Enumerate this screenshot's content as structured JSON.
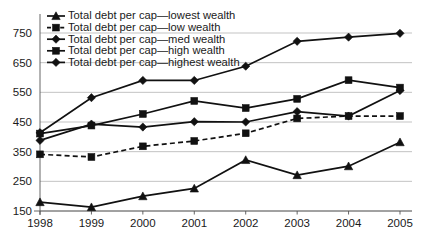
{
  "chart_data": {
    "type": "line",
    "title": "",
    "subtitle": "",
    "xlabel": "",
    "ylabel": "",
    "categories": [
      "1998",
      "1999",
      "2000",
      "2001",
      "2002",
      "2003",
      "2004",
      "2005"
    ],
    "x": [
      1998,
      1999,
      2000,
      2001,
      2002,
      2003,
      2004,
      2005
    ],
    "ylim": [
      150,
      790
    ],
    "yticks": [
      150,
      250,
      350,
      450,
      550,
      650,
      750
    ],
    "ytick_labels": [
      "150",
      "250",
      "350",
      "450",
      "550",
      "650",
      "750"
    ],
    "xtick_labels": [
      "1998",
      "1999",
      "2000",
      "2001",
      "2002",
      "2003",
      "2004",
      "2005"
    ],
    "grid": true,
    "legend_position": "top-left",
    "series": [
      {
        "name": "Total debt per cap—lowest wealth",
        "short_name": "lowest wealth",
        "marker": "triangle",
        "linestyle": "solid",
        "color": "#111111",
        "values": [
          180,
          163,
          200,
          226,
          322,
          271,
          301,
          382
        ]
      },
      {
        "name": "Total debt per cap—low wealth",
        "short_name": "low wealth",
        "marker": "square",
        "linestyle": "dashed",
        "color": "#111111",
        "values": [
          341,
          332,
          368,
          386,
          412,
          462,
          470,
          470
        ]
      },
      {
        "name": "Total debt per cap—med wealth",
        "short_name": "med wealth",
        "marker": "diamond",
        "linestyle": "solid",
        "color": "#111111",
        "values": [
          388,
          443,
          433,
          451,
          450,
          485,
          470,
          556
        ]
      },
      {
        "name": "Total debt per cap—high wealth",
        "short_name": "high wealth",
        "marker": "square",
        "linestyle": "solid",
        "color": "#111111",
        "values": [
          411,
          438,
          477,
          521,
          497,
          528,
          591,
          566
        ]
      },
      {
        "name": "Total debt per cap—highest wealth",
        "short_name": "highest wealth",
        "marker": "diamond",
        "linestyle": "solid",
        "color": "#111111",
        "values": [
          414,
          532,
          590,
          590,
          638,
          722,
          736,
          749
        ]
      }
    ],
    "legend": [
      "Total debt per cap—lowest wealth",
      "Total debt per cap—low wealth",
      "Total debt per cap—med wealth",
      "Total debt per cap—high wealth",
      "Total debt per cap—highest wealth"
    ]
  },
  "colors": {
    "ink": "#111111",
    "grid": "#b4b4b4",
    "axis": "#555555",
    "background": "#ffffff"
  }
}
